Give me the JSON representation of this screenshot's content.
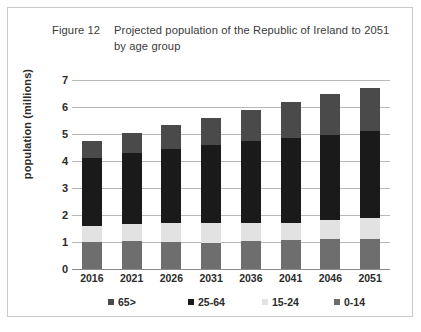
{
  "figure": {
    "number": "Figure 12",
    "title": "Projected population of the Republic of Ireland to 2051 by age group"
  },
  "chart_data": {
    "type": "bar",
    "subtype": "stacked-vertical",
    "title": "Projected population of the Republic of Ireland to 2051 by age group",
    "xlabel": "",
    "ylabel": "population (millions)",
    "ylim": [
      0,
      7
    ],
    "yticks": [
      0,
      1,
      2,
      3,
      4,
      5,
      6,
      7
    ],
    "ytick_labels": [
      "0",
      "1",
      "2",
      "3",
      "4",
      "5",
      "6",
      "7"
    ],
    "grid": true,
    "legend_position": "bottom",
    "categories": [
      "2016",
      "2021",
      "2026",
      "2031",
      "2036",
      "2041",
      "2046",
      "2051"
    ],
    "stack_order_bottom_to_top": [
      "0-14",
      "15-24",
      "25-64",
      "65>"
    ],
    "series": [
      {
        "name": "0-14",
        "color": "#6e6e6e",
        "values": [
          1.0,
          1.05,
          1.0,
          0.97,
          1.02,
          1.07,
          1.1,
          1.13
        ]
      },
      {
        "name": "15-24",
        "color": "#e2e2e2",
        "values": [
          0.6,
          0.6,
          0.7,
          0.75,
          0.68,
          0.65,
          0.7,
          0.77
        ]
      },
      {
        "name": "25-64",
        "color": "#1a1a1a",
        "values": [
          2.5,
          2.65,
          2.75,
          2.88,
          3.05,
          3.15,
          3.15,
          3.2
        ]
      },
      {
        "name": "65>",
        "color": "#4a4a4a",
        "values": [
          0.65,
          0.75,
          0.9,
          1.0,
          1.15,
          1.33,
          1.52,
          1.62
        ]
      }
    ],
    "totals": [
      4.75,
      5.05,
      5.35,
      5.6,
      5.9,
      6.2,
      6.47,
      6.72
    ]
  },
  "legend": {
    "items": [
      {
        "label": "65>",
        "color": "#4a4a4a"
      },
      {
        "label": "25-64",
        "color": "#1a1a1a"
      },
      {
        "label": "15-24",
        "color": "#e2e2e2"
      },
      {
        "label": "0-14",
        "color": "#6e6e6e"
      }
    ]
  }
}
